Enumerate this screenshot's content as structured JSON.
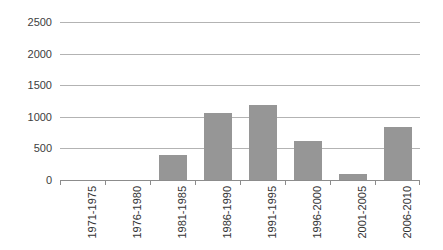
{
  "chart_data": {
    "type": "bar",
    "title": "",
    "subtitle": "",
    "xlabel": "",
    "ylabel": "",
    "categories": [
      "1971-1975",
      "1976-1980",
      "1981-1985",
      "1986-1990",
      "1991-1995",
      "1996-2000",
      "2001-2005",
      "2006-2010"
    ],
    "values": [
      0,
      0,
      400,
      1060,
      1190,
      620,
      100,
      840
    ],
    "ylim": [
      0,
      2500
    ],
    "yticks": [
      0,
      500,
      1000,
      1500,
      2000,
      2500
    ],
    "ytick_labels": [
      "0",
      "500",
      "1000",
      "1500",
      "2000",
      "2500"
    ],
    "grid": true,
    "legend": false,
    "bar_color": "#969696",
    "gridline_color": "#b3b3b3",
    "axis_color": "#8c8c8c",
    "label_color": "#333333",
    "background": "#ffffff"
  }
}
